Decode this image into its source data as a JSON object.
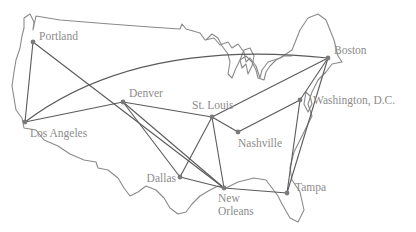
{
  "diagram": {
    "type": "network-map",
    "colors": {
      "outline": "#8a8a8a",
      "edge": "#5a5a5a",
      "node": "#7a7a7a",
      "label": "#8c8c8c"
    },
    "cities": [
      {
        "id": "portland",
        "label": "Portland",
        "x": 33,
        "y": 42
      },
      {
        "id": "los-angeles",
        "label": "Los Angeles",
        "x": 25,
        "y": 122
      },
      {
        "id": "denver",
        "label": "Denver",
        "x": 123,
        "y": 102
      },
      {
        "id": "st-louis",
        "label": "St. Louis",
        "x": 212,
        "y": 117
      },
      {
        "id": "nashville",
        "label": "Nashville",
        "x": 238,
        "y": 132
      },
      {
        "id": "dallas",
        "label": "Dallas",
        "x": 180,
        "y": 177
      },
      {
        "id": "new-orleans",
        "label": "New Orleans",
        "label_line1": "New",
        "label_line2": "Orleans",
        "x": 224,
        "y": 188
      },
      {
        "id": "tampa",
        "label": "Tampa",
        "x": 287,
        "y": 193
      },
      {
        "id": "washington-dc",
        "label": "Washington, D.C.",
        "x": 300,
        "y": 100
      },
      {
        "id": "boston",
        "label": "Boston",
        "x": 328,
        "y": 58
      }
    ],
    "edges": [
      [
        "portland",
        "los-angeles"
      ],
      [
        "portland",
        "new-orleans"
      ],
      [
        "los-angeles",
        "boston"
      ],
      [
        "los-angeles",
        "denver"
      ],
      [
        "denver",
        "st-louis"
      ],
      [
        "denver",
        "dallas"
      ],
      [
        "denver",
        "new-orleans"
      ],
      [
        "st-louis",
        "boston"
      ],
      [
        "st-louis",
        "nashville"
      ],
      [
        "st-louis",
        "dallas"
      ],
      [
        "st-louis",
        "new-orleans"
      ],
      [
        "dallas",
        "new-orleans"
      ],
      [
        "new-orleans",
        "tampa"
      ],
      [
        "nashville",
        "washington-dc"
      ],
      [
        "washington-dc",
        "boston"
      ],
      [
        "washington-dc",
        "tampa"
      ],
      [
        "boston",
        "tampa"
      ]
    ]
  }
}
